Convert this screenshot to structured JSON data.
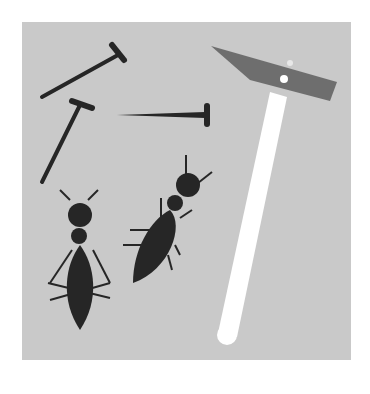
{
  "illustration": {
    "subject": "nails, hammer and ants",
    "colors": {
      "background": "#c9c9c9",
      "ink": "#262626",
      "hammer_head": "#6e6e6e",
      "handle": "#ffffff"
    },
    "elements": [
      "nail",
      "nail",
      "nail",
      "hammer",
      "ant",
      "ant"
    ]
  }
}
